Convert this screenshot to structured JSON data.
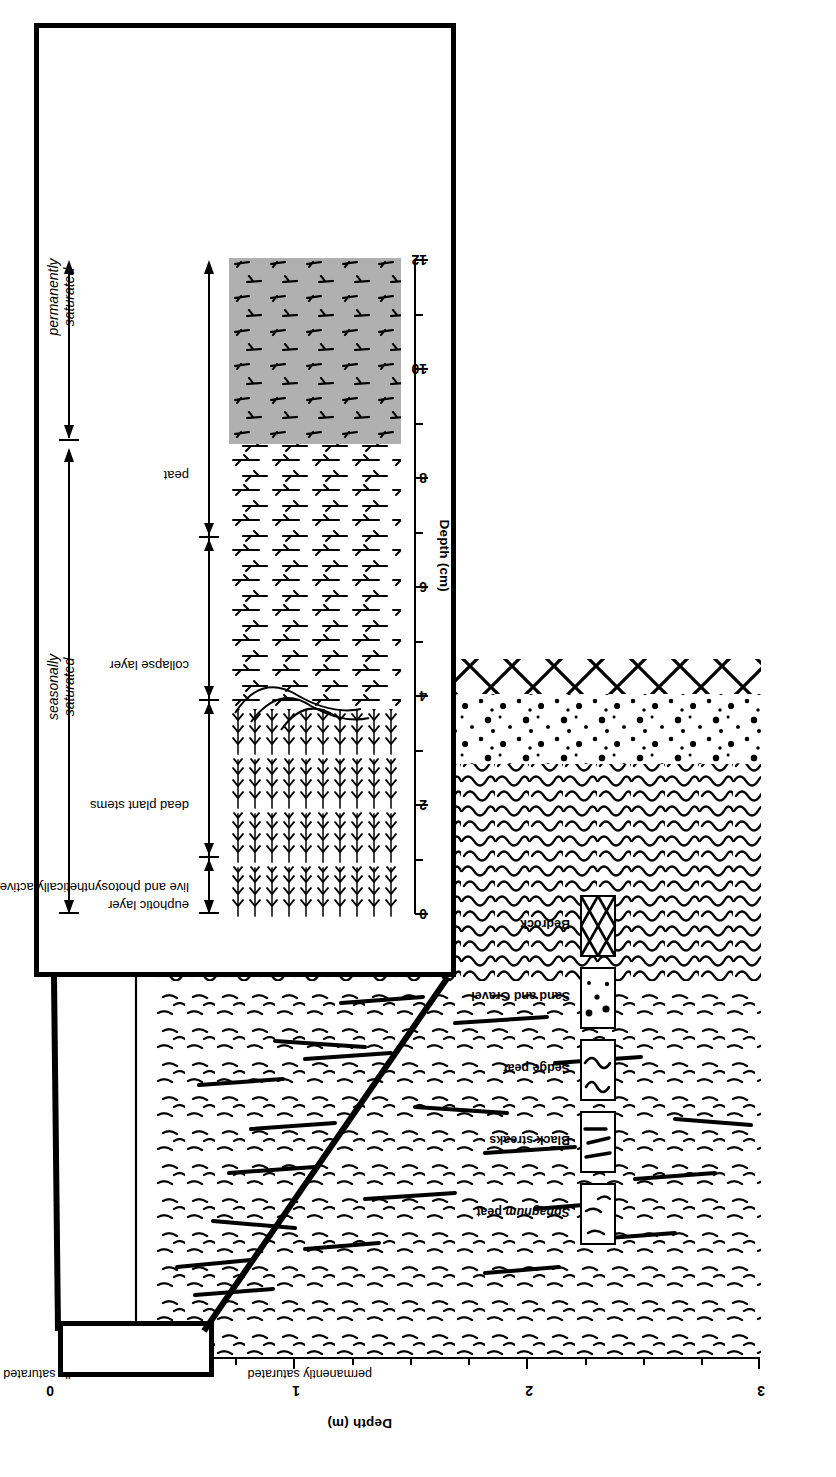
{
  "figure": {
    "type": "stratigraphic-cross-section",
    "orientation_note": "figure printed rotated 90 degrees in the page scan"
  },
  "main_panel": {
    "axis": {
      "title": "Depth (m)",
      "unit": "m",
      "ticks": [
        "0",
        "1",
        "2",
        "3"
      ],
      "tick_values": [
        0,
        1,
        2,
        3
      ],
      "minor_step": 0.25,
      "range": [
        0,
        3
      ]
    },
    "zones": [
      {
        "label": "seasonally saturated",
        "from_m": 0.0,
        "to_m": 0.12
      },
      {
        "label": "permanently saturated",
        "from_m": 0.12,
        "to_m": 3.0
      }
    ],
    "strata": [
      {
        "name": "Sphagnum peat",
        "pattern": "sphagnum",
        "from_m": 0.0,
        "to_m": 1.62
      },
      {
        "name": "Black streaks",
        "pattern": "black-streaks",
        "from_m": 0.25,
        "to_m": 1.6
      },
      {
        "name": "Sedge peat",
        "pattern": "sedge",
        "from_m": 1.62,
        "to_m": 2.55
      },
      {
        "name": "Sand and Gravel",
        "pattern": "sand-gravel",
        "from_m": 2.55,
        "to_m": 2.85
      },
      {
        "name": "Bedrock",
        "pattern": "bedrock",
        "from_m": 2.85,
        "to_m": 3.0
      }
    ]
  },
  "inset_panel": {
    "axis": {
      "title": "Depth (cm)",
      "unit": "cm",
      "ticks": [
        "0",
        "2",
        "4",
        "6",
        "8",
        "10",
        "12"
      ],
      "tick_values": [
        0,
        2,
        4,
        6,
        8,
        10,
        12
      ],
      "minor_step": 1,
      "range": [
        0,
        12
      ]
    },
    "zones": [
      {
        "label": "seasonally saturated",
        "from_cm": 0.0,
        "to_cm": 8.6,
        "italic": true
      },
      {
        "label": "permanently saturated",
        "from_cm": 8.6,
        "to_cm": 12.0,
        "italic": true
      }
    ],
    "layers": [
      {
        "label": "euphotic layer",
        "sublabel": "live and photosynthetically active plants",
        "from_cm": 0.0,
        "to_cm": 1.1
      },
      {
        "label": "dead plant stems",
        "from_cm": 1.1,
        "to_cm": 4.0
      },
      {
        "label": "collapse layer",
        "from_cm": 4.0,
        "to_cm": 7.0
      },
      {
        "label": "peat",
        "from_cm": 7.0,
        "to_cm": 12.0
      }
    ],
    "shaded_region": {
      "label": "peat",
      "from_cm": 8.6,
      "to_cm": 12.0,
      "fill": "#b0b0b0"
    }
  },
  "legend": {
    "items": [
      {
        "label": "Sphagnum peat",
        "italic_word": "Sphagnum",
        "swatch": "sphagnum"
      },
      {
        "label": "Black streaks",
        "swatch": "black-streaks"
      },
      {
        "label": "Sedge peat",
        "swatch": "sedge"
      },
      {
        "label": "Sand and Gravel",
        "swatch": "sand-gravel"
      },
      {
        "label": "Bedrock",
        "swatch": "bedrock"
      }
    ]
  },
  "colors": {
    "ink": "#000000",
    "paper": "#ffffff",
    "shade": "#b0b0b0"
  }
}
